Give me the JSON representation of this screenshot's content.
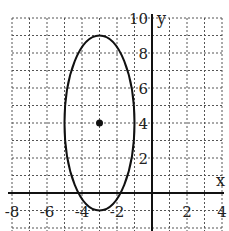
{
  "chart_data": {
    "type": "line",
    "title": "",
    "xlabel": "x",
    "ylabel": "y",
    "xlim": [
      -8,
      4
    ],
    "ylim": [
      -1.5,
      10
    ],
    "grid": true,
    "x_ticks": [
      "-8",
      "-6",
      "-4",
      "-2",
      "2",
      "4"
    ],
    "y_ticks": [
      "2",
      "4",
      "6",
      "8",
      "10"
    ],
    "shapes": [
      {
        "type": "ellipse",
        "center": [
          -3,
          4
        ],
        "rx": 2,
        "ry": 5
      },
      {
        "type": "point",
        "x": -3,
        "y": 4,
        "label": "center"
      }
    ]
  },
  "axes": {
    "x_label": "x",
    "y_label": "y"
  },
  "ticks": {
    "x": [
      {
        "v": -8,
        "t": "-8"
      },
      {
        "v": -6,
        "t": "-6"
      },
      {
        "v": -4,
        "t": "-4"
      },
      {
        "v": -2,
        "t": "-2"
      },
      {
        "v": 2,
        "t": "2"
      },
      {
        "v": 4,
        "t": "4"
      }
    ],
    "y": [
      {
        "v": 2,
        "t": "2"
      },
      {
        "v": 4,
        "t": "4"
      },
      {
        "v": 6,
        "t": "6"
      },
      {
        "v": 8,
        "t": "8"
      },
      {
        "v": 10,
        "t": "10"
      }
    ]
  }
}
